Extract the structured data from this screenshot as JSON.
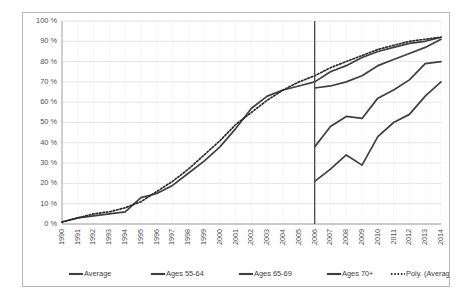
{
  "chart_data": {
    "type": "line",
    "title": "",
    "xlabel": "",
    "ylabel": "",
    "ylim": [
      0,
      100
    ],
    "ytick_labels": [
      "0 %",
      "10 %",
      "20 %",
      "30 %",
      "40 %",
      "50 %",
      "60 %",
      "70 %",
      "80 %",
      "90 %",
      "100 %"
    ],
    "ytick_values": [
      0,
      10,
      20,
      30,
      40,
      50,
      60,
      70,
      80,
      90,
      100
    ],
    "grid": true,
    "legend_position": "bottom",
    "categories": [
      "1990",
      "1991",
      "1992",
      "1993",
      "1994",
      "1995",
      "1996",
      "1997",
      "1998",
      "1999",
      "2000",
      "2001",
      "2002",
      "2003",
      "2004",
      "2005",
      "2006",
      "2007",
      "2008",
      "2009",
      "2010",
      "2011",
      "2012",
      "2013",
      "2014"
    ],
    "annotations": [
      {
        "name": "vertical-divider",
        "at_category": "2006",
        "label": "2006"
      }
    ],
    "series": [
      {
        "name": "Average",
        "style": "solid",
        "color": "#3f3f3f",
        "x": [
          "1990",
          "1991",
          "1992",
          "1993",
          "1994",
          "1995",
          "1996",
          "1997",
          "1998",
          "1999",
          "2000",
          "2001",
          "2002",
          "2003",
          "2004",
          "2005",
          "2006",
          "2007",
          "2008",
          "2009",
          "2010",
          "2011",
          "2012",
          "2013",
          "2014"
        ],
        "values": [
          1,
          3,
          4,
          5,
          6,
          13,
          15,
          19,
          25,
          31,
          38,
          47,
          57,
          63,
          66,
          68,
          70,
          75,
          78,
          82,
          85,
          87,
          89,
          90,
          92
        ]
      },
      {
        "name": "Ages 55-64",
        "style": "solid",
        "color": "#3f3f3f",
        "x": [
          "2006",
          "2007",
          "2008",
          "2009",
          "2010",
          "2011",
          "2012",
          "2013",
          "2014"
        ],
        "values": [
          67,
          68,
          70,
          73,
          78,
          81,
          84,
          87,
          91
        ]
      },
      {
        "name": "Ages 65-69",
        "style": "solid",
        "color": "#3f3f3f",
        "x": [
          "2006",
          "2007",
          "2008",
          "2009",
          "2010",
          "2011",
          "2012",
          "2013",
          "2014"
        ],
        "values": [
          38,
          48,
          53,
          52,
          62,
          66,
          71,
          79,
          80
        ]
      },
      {
        "name": "Ages 70+",
        "style": "solid",
        "color": "#3f3f3f",
        "x": [
          "2006",
          "2007",
          "2008",
          "2009",
          "2010",
          "2011",
          "2012",
          "2013",
          "2014"
        ],
        "values": [
          21,
          27,
          34,
          29,
          43,
          50,
          54,
          63,
          70
        ]
      },
      {
        "name": "Poly. (Average)",
        "style": "dotted",
        "color": "#2b2b2b",
        "trendline_of": "Average",
        "x": [
          "1990",
          "1991",
          "1992",
          "1993",
          "1994",
          "1995",
          "1996",
          "1997",
          "1998",
          "1999",
          "2000",
          "2001",
          "2002",
          "2003",
          "2004",
          "2005",
          "2006",
          "2007",
          "2008",
          "2009",
          "2010",
          "2011",
          "2012",
          "2013",
          "2014"
        ],
        "values": [
          1,
          3,
          5,
          6,
          8,
          11,
          16,
          21,
          27,
          34,
          41,
          49,
          55,
          61,
          66,
          70,
          73,
          77,
          80,
          83,
          86,
          88,
          90,
          91,
          92
        ]
      }
    ],
    "legend": [
      {
        "label": "Average",
        "style": "solid"
      },
      {
        "label": "Ages 55-64",
        "style": "solid"
      },
      {
        "label": "Ages 65-69",
        "style": "solid"
      },
      {
        "label": "Ages 70+",
        "style": "solid"
      },
      {
        "label": "Poly. (Average)",
        "style": "dotted"
      }
    ]
  }
}
